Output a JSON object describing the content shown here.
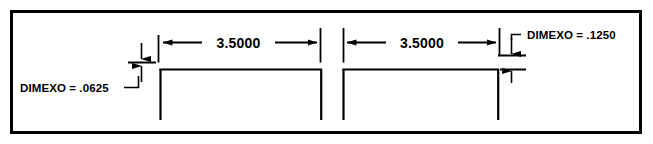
{
  "figure": {
    "type": "technical-drawing",
    "background_color": "#ffffff",
    "line_color": "#000000",
    "border": {
      "name": "figure-border",
      "stroke_width": 3
    }
  },
  "dimensions": [
    {
      "id": "left-span",
      "value": "3.5000",
      "orientation": "horizontal"
    },
    {
      "id": "right-span",
      "value": "3.5000",
      "orientation": "horizontal"
    }
  ],
  "annotations": [
    {
      "id": "dimexo-left",
      "text": "DIMEXO = .0625",
      "variable": "DIMEXO",
      "value": ".0625",
      "position": "lower-left"
    },
    {
      "id": "dimexo-right",
      "text": "DIMEXO = .1250",
      "variable": "DIMEXO",
      "value": ".1250",
      "position": "upper-right"
    }
  ],
  "geometry": {
    "shape": "open-bottom-rectangles",
    "count": 2,
    "note": "two bracket profiles separated by a gap"
  }
}
